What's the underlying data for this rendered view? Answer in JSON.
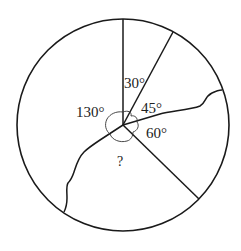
{
  "diagram": {
    "type": "circle-angle-diagram",
    "colors": {
      "stroke": "#1a1a1a",
      "background": "#ffffff",
      "text": "#222222",
      "arc": "#333333"
    },
    "labels": {
      "angle_30": "30°",
      "angle_45": "45°",
      "angle_60": "60°",
      "angle_130": "130°",
      "unknown": "?"
    },
    "angles": [
      {
        "name": "angle_30",
        "value": 30,
        "label": "30°"
      },
      {
        "name": "angle_45",
        "value": 45,
        "label": "45°"
      },
      {
        "name": "angle_60",
        "value": 60,
        "label": "60°"
      },
      {
        "name": "angle_130",
        "value": 130,
        "label": "130°"
      },
      {
        "name": "unknown",
        "value": null,
        "label": "?"
      }
    ]
  }
}
